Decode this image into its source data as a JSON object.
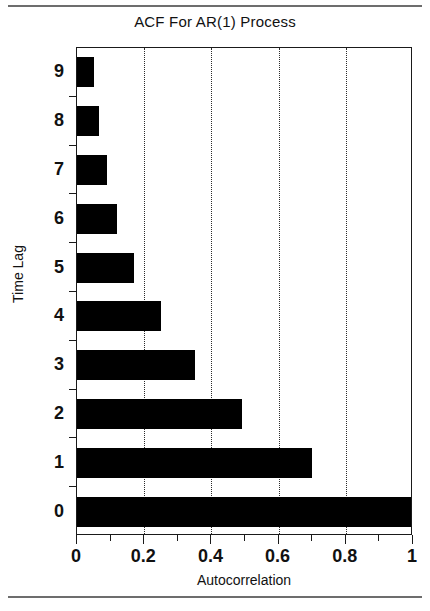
{
  "figure": {
    "title": "ACF For AR(1) Process",
    "background": "#ffffff",
    "bar_color": "#000000",
    "axis_color": "#1a1a1a",
    "rule_color": "#6d6d6d"
  },
  "chart_data": {
    "type": "bar",
    "orientation": "horizontal",
    "title": "ACF For AR(1) Process",
    "xlabel": "Autocorrelation",
    "ylabel": "Time Lag",
    "categories": [
      "0",
      "1",
      "2",
      "3",
      "4",
      "5",
      "6",
      "7",
      "8",
      "9"
    ],
    "values": [
      1.0,
      0.7,
      0.49,
      0.35,
      0.25,
      0.17,
      0.12,
      0.09,
      0.065,
      0.05
    ],
    "xlim": [
      0,
      1
    ],
    "ylim": [
      -0.5,
      9.5
    ],
    "xticks": [
      0,
      0.2,
      0.4,
      0.6,
      0.8,
      1
    ],
    "xticklabels": [
      "0",
      "0.2",
      "0.4",
      "0.6",
      "0.8",
      "1"
    ],
    "xminorticks": [
      0.1,
      0.3,
      0.5,
      0.7,
      0.9
    ],
    "yticks": [
      0,
      1,
      2,
      3,
      4,
      5,
      6,
      7,
      8,
      9
    ],
    "yticklabels": [
      "0",
      "1",
      "2",
      "3",
      "4",
      "5",
      "6",
      "7",
      "8",
      "9"
    ],
    "grid": {
      "vertical": true,
      "horizontal": false,
      "style": "dotted",
      "at": [
        0.2,
        0.4,
        0.6,
        0.8
      ]
    },
    "legend": null,
    "series": [
      {
        "name": "Autocorrelation",
        "points": [
          {
            "lag": "0",
            "value": 1.0
          },
          {
            "lag": "1",
            "value": 0.7
          },
          {
            "lag": "2",
            "value": 0.49
          },
          {
            "lag": "3",
            "value": 0.35
          },
          {
            "lag": "4",
            "value": 0.25
          },
          {
            "lag": "5",
            "value": 0.17
          },
          {
            "lag": "6",
            "value": 0.12
          },
          {
            "lag": "7",
            "value": 0.09
          },
          {
            "lag": "8",
            "value": 0.065
          },
          {
            "lag": "9",
            "value": 0.05
          }
        ]
      }
    ]
  }
}
